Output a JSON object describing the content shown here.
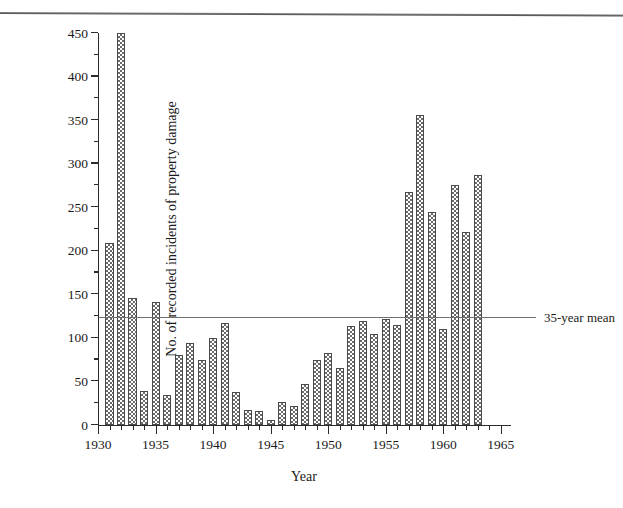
{
  "figure": {
    "background": "#ffffff",
    "ink": "#2b2b2b",
    "bar_outline": "#4a4a4a",
    "bar_hatch": "#6b6b6b",
    "mean_line_color": "#707070",
    "top_rule": "page-separator-rule"
  },
  "annotations": {
    "mean_label": "35-year mean"
  },
  "chart_data": {
    "type": "bar",
    "title": "",
    "xlabel": "Year",
    "ylabel": "No. of recorded incidents of property damage",
    "xlim": [
      1930,
      1965.8
    ],
    "ylim": [
      0,
      450
    ],
    "ytick_major": [
      0,
      50,
      100,
      150,
      200,
      250,
      300,
      350,
      400,
      450
    ],
    "ytick_major_labels": [
      "0",
      "50",
      "100",
      "150",
      "200",
      "250",
      "300",
      "350",
      "400",
      "450"
    ],
    "ytick_minor": [
      25,
      75,
      125,
      175,
      225,
      275,
      325,
      375,
      425
    ],
    "xtick_major": [
      1930,
      1935,
      1940,
      1945,
      1950,
      1955,
      1960,
      1965
    ],
    "xtick_major_labels": [
      "1930",
      "1935",
      "1940",
      "1945",
      "1950",
      "1955",
      "1960",
      "1965"
    ],
    "grid": false,
    "legend": null,
    "categories": [
      "1931",
      "1932",
      "1933",
      "1934",
      "1935",
      "1936",
      "1937",
      "1938",
      "1939",
      "1940",
      "1941",
      "1942",
      "1943",
      "1944",
      "1945",
      "1946",
      "1947",
      "1948",
      "1949",
      "1950",
      "1951",
      "1952",
      "1953",
      "1954",
      "1955",
      "1956",
      "1957",
      "1958",
      "1959",
      "1960",
      "1961",
      "1962",
      "1963",
      "1964",
      "1965"
    ],
    "values": [
      209,
      450,
      146,
      39,
      141,
      34,
      80,
      94,
      75,
      100,
      117,
      38,
      17,
      16,
      6,
      26,
      22,
      47,
      75,
      83,
      65,
      114,
      119,
      104,
      122,
      115,
      267,
      356,
      245,
      110,
      275,
      222,
      287,
      0,
      0
    ],
    "reference_lines": [
      {
        "name": "35-year mean",
        "value": 123,
        "style": "solid"
      }
    ]
  }
}
